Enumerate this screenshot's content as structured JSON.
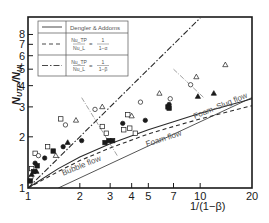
{
  "chart_data": {
    "type": "scatter",
    "title": "",
    "xlabel": "1/(1−β)",
    "ylabel": "N_UTP/N_UL",
    "xscale": "log",
    "yscale": "log",
    "xlim": [
      1,
      20
    ],
    "ylim": [
      1,
      10
    ],
    "x_ticks": [
      1,
      2,
      3,
      4,
      5,
      7,
      10,
      20
    ],
    "y_ticks": [
      1,
      2,
      3,
      4,
      5,
      6,
      7,
      8
    ],
    "grid": false,
    "legend": {
      "position": "upper-left",
      "entries": [
        {
          "style": "solid",
          "label": "Dengler & Addoms"
        },
        {
          "style": "dashed",
          "label": "Nu_TP/Nu_L = 1/(1−α)",
          "num": "Nu_TP",
          "den": "Nu_L",
          "rhs_num": "1",
          "rhs_den": "1−α"
        },
        {
          "style": "dashdot",
          "label": "Nu_TP/Nu_L = 1/(1−β)",
          "num": "Nu_TP",
          "den": "Nu_L",
          "rhs_num": "1",
          "rhs_den": "1−β"
        }
      ]
    },
    "lines": [
      {
        "name": "Dengler & Addoms",
        "style": "solid",
        "x": [
          1,
          1.5,
          2,
          3,
          5,
          7,
          10,
          20
        ],
        "y": [
          1,
          1.3,
          1.52,
          1.82,
          2.2,
          2.45,
          2.75,
          3.35
        ]
      },
      {
        "name": "Nu_TP/Nu_L = 1/(1−α)",
        "style": "dashed",
        "x": [
          1,
          1.5,
          2,
          3,
          5,
          7,
          10,
          20
        ],
        "y": [
          1,
          1.25,
          1.45,
          1.72,
          2.08,
          2.3,
          2.55,
          3.05
        ]
      },
      {
        "name": "Nu_TP/Nu_L = 1/(1−β)",
        "style": "dashdot",
        "x": [
          1,
          10
        ],
        "y": [
          1,
          10
        ]
      },
      {
        "name": "bubble-boundary",
        "style": "thin-solid",
        "x": [
          1.5,
          20
        ],
        "y": [
          1,
          3.4
        ]
      }
    ],
    "regime_boundaries": [
      {
        "x": [
          2.05,
          3.3
        ],
        "y": [
          3.4,
          1.55
        ]
      },
      {
        "x": [
          7.0,
          10.5
        ],
        "y": [
          5.0,
          3.4
        ]
      }
    ],
    "annotations": [
      {
        "text": "Bubble flow",
        "x": 1.6,
        "y": 1.18,
        "angle": -22
      },
      {
        "text": "Foam flow",
        "x": 4.9,
        "y": 1.75,
        "angle": -18
      },
      {
        "text": "Foam–Slug flow",
        "x": 9.3,
        "y": 2.55,
        "angle": -22
      }
    ],
    "series": [
      {
        "name": "open-square",
        "marker": "square-open",
        "x": [
          1.05,
          1.1,
          1.3,
          1.55,
          2.7,
          2.85,
          3.6,
          3.9,
          3.8,
          4.2
        ],
        "y": [
          1.3,
          1.6,
          1.75,
          2.55,
          2.3,
          2.1,
          2.2,
          2.25,
          2.7,
          2.1
        ]
      },
      {
        "name": "open-circle",
        "marker": "circle-open",
        "x": [
          1.04,
          1.15,
          1.65,
          2.45,
          4.5,
          8.8,
          6.7
        ],
        "y": [
          1.15,
          1.55,
          2.35,
          2.9,
          3.2,
          4.05,
          3.35
        ]
      },
      {
        "name": "open-triangle",
        "marker": "triangle-open",
        "x": [
          1.45,
          1.9,
          2.7,
          4.0,
          5.8,
          9.5,
          14.0
        ],
        "y": [
          1.55,
          2.5,
          3.0,
          2.65,
          3.6,
          4.5,
          5.3
        ]
      },
      {
        "name": "filled-circle",
        "marker": "circle-filled",
        "x": [
          1.1,
          1.25,
          1.6,
          2.05,
          3.55,
          4.8,
          6.6
        ],
        "y": [
          1.4,
          1.5,
          1.75,
          1.9,
          2.4,
          2.5,
          3.1
        ]
      },
      {
        "name": "filled-triangle",
        "marker": "triangle-filled",
        "x": [
          1.05,
          1.12,
          1.7,
          9.7,
          12.0
        ],
        "y": [
          1.2,
          1.25,
          1.85,
          3.45,
          3.6
        ]
      },
      {
        "name": "filled-square",
        "marker": "square-filled",
        "x": [
          1.03,
          1.08,
          1.13,
          1.4,
          2.8,
          2.95,
          3.1,
          6.5,
          6.6
        ],
        "y": [
          1.1,
          1.25,
          1.35,
          1.65,
          1.85,
          1.9,
          1.9,
          3.0,
          2.95
        ]
      }
    ]
  }
}
